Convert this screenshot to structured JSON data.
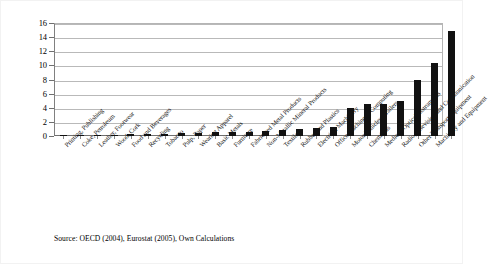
{
  "figure": {
    "background_color": "#ffffff",
    "bar_color": "#111111",
    "gridline_color": "#b9b9b9",
    "axis_color": "#6f6f6f"
  },
  "source_note": "Source: OECD (2004), Eurostat (2005), Own Calculations",
  "chart_data": {
    "type": "bar",
    "title": "",
    "subtitle": "",
    "xlabel": "",
    "ylabel": "",
    "ylim": [
      0,
      16
    ],
    "yticks": [
      0,
      2,
      4,
      6,
      8,
      10,
      12,
      14,
      16
    ],
    "ytick_labels": [
      "0",
      "2",
      "4",
      "6",
      "8",
      "10",
      "12",
      "14",
      "16"
    ],
    "grid": true,
    "legend": false,
    "legend_position": "none",
    "orientation": "vertical",
    "categories": [
      "Printing, Publishing",
      "Coke, Petroleum",
      "Leather, Footwear",
      "Wood, Cork",
      "Food and Beverages",
      "Recycling",
      "Tobacco",
      "Pulp, Paper",
      "Wearing Apparel",
      "Basic Metals",
      "Furniture",
      "Fabricated Metal Products",
      "Non-Metallic Mineral Products",
      "Textiles",
      "Rubber and Plastics",
      "Electrical Machinery",
      "Office Machinery, Computing",
      "Motor Vehicles, Trailers",
      "Chemicals",
      "Medical, Optical Instruments",
      "Radio, Television and Communication",
      "Other Transport Equipment",
      "Machinery and Equipment"
    ],
    "values": [
      0.08,
      0.12,
      0.15,
      0.2,
      0.25,
      0.3,
      0.35,
      0.4,
      0.45,
      0.5,
      0.55,
      0.6,
      0.7,
      0.85,
      1.0,
      1.15,
      1.3,
      3.9,
      4.5,
      4.5,
      4.9,
      8.0,
      10.3
    ],
    "values_note": "final bar value 14.8",
    "values_full": [
      0.08,
      0.12,
      0.15,
      0.2,
      0.25,
      0.3,
      0.35,
      0.4,
      0.45,
      0.5,
      0.55,
      0.6,
      0.7,
      0.85,
      1.0,
      1.15,
      1.3,
      3.9,
      4.5,
      4.5,
      4.9,
      8.0,
      10.3,
      14.8
    ]
  }
}
